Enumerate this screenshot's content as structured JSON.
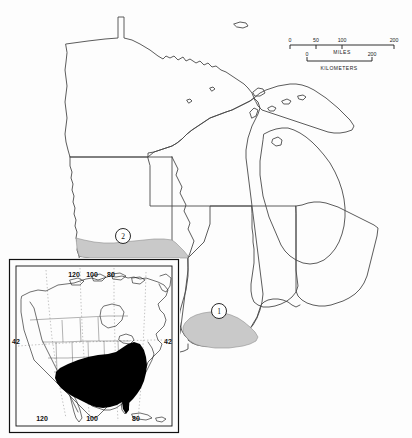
{
  "figure": {
    "type": "distribution-map",
    "region": "Upper Midwest United States",
    "background_color": "#fdfdfd",
    "outline_color": "#4a4a4a",
    "shade_color": "#c9c9c9",
    "range_color": "#000000"
  },
  "scale_bar": {
    "miles": {
      "unit_label": "MILES",
      "ticks": [
        "0",
        "50",
        "100",
        "200"
      ],
      "tick_fractions": [
        0.0,
        0.25,
        0.5,
        1.0
      ]
    },
    "kilometers": {
      "unit_label": "KILOMETERS",
      "ticks": [
        "0",
        "200"
      ],
      "tick_fractions": [
        0.0,
        1.0
      ]
    }
  },
  "locality_markers": [
    {
      "label": "1",
      "cx": 219,
      "cy": 311,
      "r": 7.5,
      "area": "southern Illinois"
    },
    {
      "label": "2",
      "cx": 123,
      "cy": 236,
      "r": 7.5,
      "area": "southern Iowa"
    }
  ],
  "shaded_areas": [
    {
      "name": "iowa-southern-band",
      "fill": "#c9c9c9"
    },
    {
      "name": "illinois-southern-area",
      "fill": "#c9c9c9"
    }
  ],
  "inset": {
    "title_area": "North America",
    "frame_color": "#111111",
    "range_fill": "#000000",
    "longitude_labels_top": [
      "120",
      "100",
      "80"
    ],
    "longitude_labels_bottom": [
      "120",
      "100",
      "80"
    ],
    "latitude_label_left": "42",
    "latitude_label_right": "42"
  }
}
